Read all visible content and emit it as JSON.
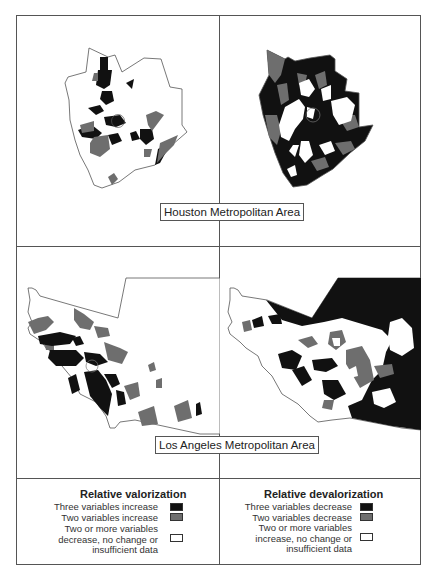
{
  "figure": {
    "panels": [
      {
        "id": "houston-valorization",
        "region": "Houston",
        "measure": "Relative valorization"
      },
      {
        "id": "houston-devalorization",
        "region": "Houston",
        "measure": "Relative devalorization"
      },
      {
        "id": "la-valorization",
        "region": "Los Angeles",
        "measure": "Relative valorization"
      },
      {
        "id": "la-devalorization",
        "region": "Los Angeles",
        "measure": "Relative devalorization"
      }
    ],
    "labels": {
      "houston": "Houston Metropolitan Area",
      "la": "Los Angeles Metropolitan Area"
    }
  },
  "colors": {
    "three_variables": "#111111",
    "two_variables": "#6e6e6e",
    "none": "#ffffff",
    "border": "#555555"
  },
  "legend": {
    "valorization": {
      "title": "Relative valorization",
      "items": [
        {
          "label": "Three variables increase",
          "swatch": "#111111"
        },
        {
          "label": "Two variables increase",
          "swatch": "#6e6e6e"
        },
        {
          "label_lines": [
            "Two or more variables",
            "decrease, no change or",
            "insufficient data"
          ],
          "swatch": "#ffffff"
        }
      ]
    },
    "devalorization": {
      "title": "Relative devalorization",
      "items": [
        {
          "label": "Three variables decrease",
          "swatch": "#111111"
        },
        {
          "label": "Two variables decrease",
          "swatch": "#6e6e6e"
        },
        {
          "label_lines": [
            "Two or more variables",
            "increase, no change or",
            "insufficient data"
          ],
          "swatch": "#ffffff"
        }
      ]
    }
  }
}
